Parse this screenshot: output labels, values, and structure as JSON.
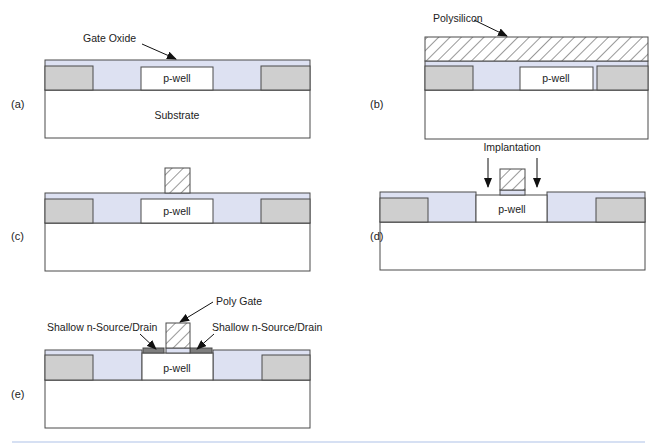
{
  "colors": {
    "oxide": "#dde1f2",
    "isolation": "#cfcfcf",
    "substrate": "#ffffff",
    "pwell": "#ffffff",
    "source_drain": "#7e7e7e",
    "outline": "#4a4a4a",
    "hatch": "#333333",
    "footer_rule": "#c9d6ef"
  },
  "panels": {
    "a": {
      "label": "(a)",
      "pwell_label": "p-well",
      "substrate_label": "Substrate",
      "annotation": "Gate Oxide"
    },
    "b": {
      "label": "(b)",
      "pwell_label": "p-well",
      "annotation": "Polysilicon"
    },
    "c": {
      "label": "(c)",
      "pwell_label": "p-well"
    },
    "d": {
      "label": "(d)",
      "pwell_label": "p-well",
      "annotation": "Implantation"
    },
    "e": {
      "label": "(e)",
      "pwell_label": "p-well",
      "annotation_gate": "Poly Gate",
      "annotation_sd_left": "Shallow n-Source/Drain",
      "annotation_sd_right": "Shallow n-Source/Drain"
    }
  }
}
